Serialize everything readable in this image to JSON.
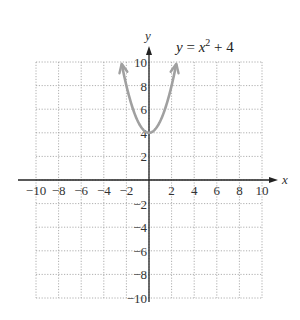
{
  "chart_data": {
    "type": "line",
    "title_parts": {
      "lhs": "y",
      "eq": " = ",
      "base": "x",
      "exp": "2",
      "rest": " + 4"
    },
    "xlabel": "x",
    "ylabel": "y",
    "xlim": [
      -10,
      10
    ],
    "ylim": [
      -10,
      10
    ],
    "grid": true,
    "x_ticks": [
      -10,
      -8,
      -6,
      -4,
      -2,
      2,
      4,
      6,
      8,
      10
    ],
    "y_ticks": [
      -10,
      -8,
      -6,
      -4,
      -2,
      2,
      4,
      6,
      8,
      10
    ],
    "x_tick_labels": [
      "−10",
      "−8",
      "−6",
      "−4",
      "−2",
      "2",
      "4",
      "6",
      "8",
      "10"
    ],
    "y_tick_labels": [
      "−10",
      "−8",
      "−6",
      "−4",
      "−2",
      "2",
      "4",
      "6",
      "8",
      "10"
    ],
    "series": [
      {
        "name": "y = x^2 + 4",
        "color": "#a0a0a0",
        "x": [
          -2.45,
          -2,
          -1.5,
          -1,
          -0.5,
          0,
          0.5,
          1,
          1.5,
          2,
          2.45
        ],
        "values": [
          10,
          8,
          6.25,
          5,
          4.25,
          4,
          4.25,
          5,
          6.25,
          8,
          10
        ]
      }
    ]
  },
  "colors": {
    "axis": "#222222",
    "grid": "#9a9a9a",
    "curve": "#a0a0a0"
  }
}
